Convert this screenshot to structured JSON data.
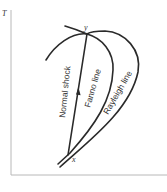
{
  "diagram": {
    "type": "T-s diagram",
    "axes": {
      "y_label": "T",
      "x_label": ""
    },
    "points": {
      "upstream": "x",
      "downstream": "y"
    },
    "curves": {
      "normal_shock": "Normal shock",
      "fanno": "Fanno line",
      "rayleigh": "Rayleigh line"
    },
    "colors": {
      "curve": "#2a2a2a",
      "axis": "#b8b8b8",
      "background": "#ffffff"
    }
  }
}
